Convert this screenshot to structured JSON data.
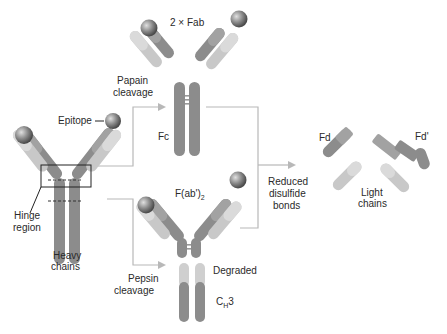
{
  "diagram": {
    "labels": {
      "fab": "2 × Fab",
      "papain_line1": "Papain",
      "papain_line2": "cleavage",
      "epitope": "Epitope",
      "fc": "Fc",
      "hinge_line1": "Hinge",
      "hinge_line2": "region",
      "heavy_line1": "Heavy",
      "heavy_line2": "chains",
      "fab2_main": "F(ab')",
      "fab2_sub": "2",
      "pepsin_line1": "Pepsin",
      "pepsin_line2": "cleavage",
      "degraded": "Degraded",
      "ch3_main": "C",
      "ch3_sub": "H",
      "ch3_tail": "3",
      "reduced_line1": "Reduced",
      "reduced_line2": "disulfide",
      "reduced_line3": "bonds",
      "fd": "Fd",
      "fd_prime": "Fd'",
      "light_line1": "Light",
      "light_line2": "chains"
    },
    "colors": {
      "heavy_chain": "#8c8c8c",
      "light_chain": "#c8c8c8",
      "antigen": "#7a7a7a",
      "connector": "#b8b8b8",
      "text": "#2a2a2a"
    }
  }
}
